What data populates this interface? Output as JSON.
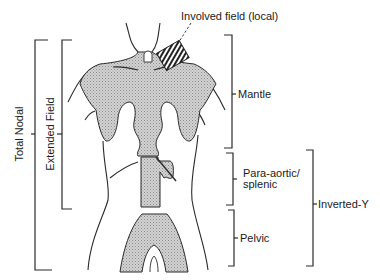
{
  "diagram": {
    "type": "anatomical radiotherapy field diagram",
    "colors": {
      "outline": "#2a2a2a",
      "shading": "#c8c8c8",
      "background": "#ffffff"
    },
    "labels": {
      "involved_field": "Involved field (local)",
      "mantle": "Mantle",
      "para_aortic": "Para-aortic/",
      "splenic": "splenic",
      "pelvic": "Pelvic",
      "inverted_y": "Inverted-Y",
      "total_nodal": "Total Nodal",
      "extended_field": "Extended Field"
    },
    "regions": [
      {
        "name": "Involved field (local)",
        "style": "hatched block at left supraclavicular/neck region"
      },
      {
        "name": "Mantle",
        "style": "shaded region covering neck, axillae and mediastinum"
      },
      {
        "name": "Para-aortic/splenic",
        "style": "shaded rectangle with splenic extension"
      },
      {
        "name": "Pelvic",
        "style": "shaded inverted-U region"
      }
    ],
    "brackets": [
      {
        "label": "Mantle",
        "side": "right",
        "spans": "upper torso"
      },
      {
        "label": "Para-aortic/splenic",
        "side": "right",
        "spans": "mid abdomen"
      },
      {
        "label": "Pelvic",
        "side": "right",
        "spans": "pelvis"
      },
      {
        "label": "Inverted-Y",
        "side": "right",
        "spans": "para-aortic + pelvic"
      },
      {
        "label": "Extended Field",
        "side": "left",
        "spans": "mantle + para-aortic"
      },
      {
        "label": "Total Nodal",
        "side": "left",
        "spans": "mantle + para-aortic + pelvic"
      }
    ]
  }
}
